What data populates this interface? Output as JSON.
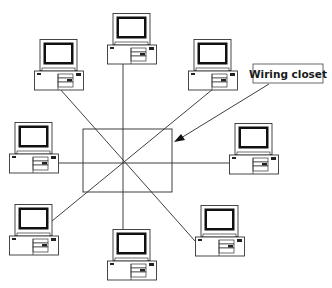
{
  "diagram": {
    "type": "star-topology-network",
    "callout": {
      "label": "Wiring closet"
    },
    "hub": {
      "x": 83,
      "y": 129,
      "w": 89,
      "h": 63,
      "center_x": 123,
      "center_y": 162
    },
    "colors": {
      "line": "#2a2a2a",
      "screen": "#111111",
      "background": "#ffffff"
    },
    "computers": [
      {
        "id": "top-center",
        "x": 107,
        "y": 13
      },
      {
        "id": "top-left",
        "x": 34,
        "y": 39
      },
      {
        "id": "top-right",
        "x": 188,
        "y": 39
      },
      {
        "id": "middle-left",
        "x": 9,
        "y": 122
      },
      {
        "id": "middle-right",
        "x": 229,
        "y": 123
      },
      {
        "id": "bottom-left",
        "x": 9,
        "y": 204
      },
      {
        "id": "bottom-center",
        "x": 107,
        "y": 229
      },
      {
        "id": "bottom-right",
        "x": 195,
        "y": 205
      }
    ]
  }
}
